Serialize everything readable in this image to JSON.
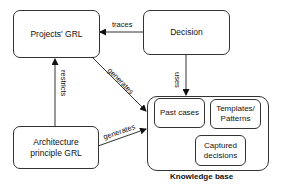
{
  "diagram": {
    "nodes": {
      "projects_grl": "Projects' GRL",
      "decision": "Decision",
      "architecture": "Architecture principle GRL",
      "knowledge_base": "Knowledge base",
      "past_cases": "Past cases",
      "templates": "Templates/ Patterns",
      "captured": "Captured decisions"
    },
    "edges": [
      {
        "from": "Decision",
        "to": "Projects' GRL",
        "label": "traces"
      },
      {
        "from": "Decision",
        "to": "Knowledge base",
        "label": "uses"
      },
      {
        "from": "Architecture principle GRL",
        "to": "Projects' GRL",
        "label": "restricts"
      },
      {
        "from": "Projects' GRL",
        "to": "Knowledge base",
        "label": "generates"
      },
      {
        "from": "Architecture principle GRL",
        "to": "Knowledge base",
        "label": "generates"
      }
    ],
    "labels": {
      "traces": "traces",
      "uses": "uses",
      "restricts": "restricts",
      "generates1": "generates",
      "generates2": "generates"
    }
  }
}
